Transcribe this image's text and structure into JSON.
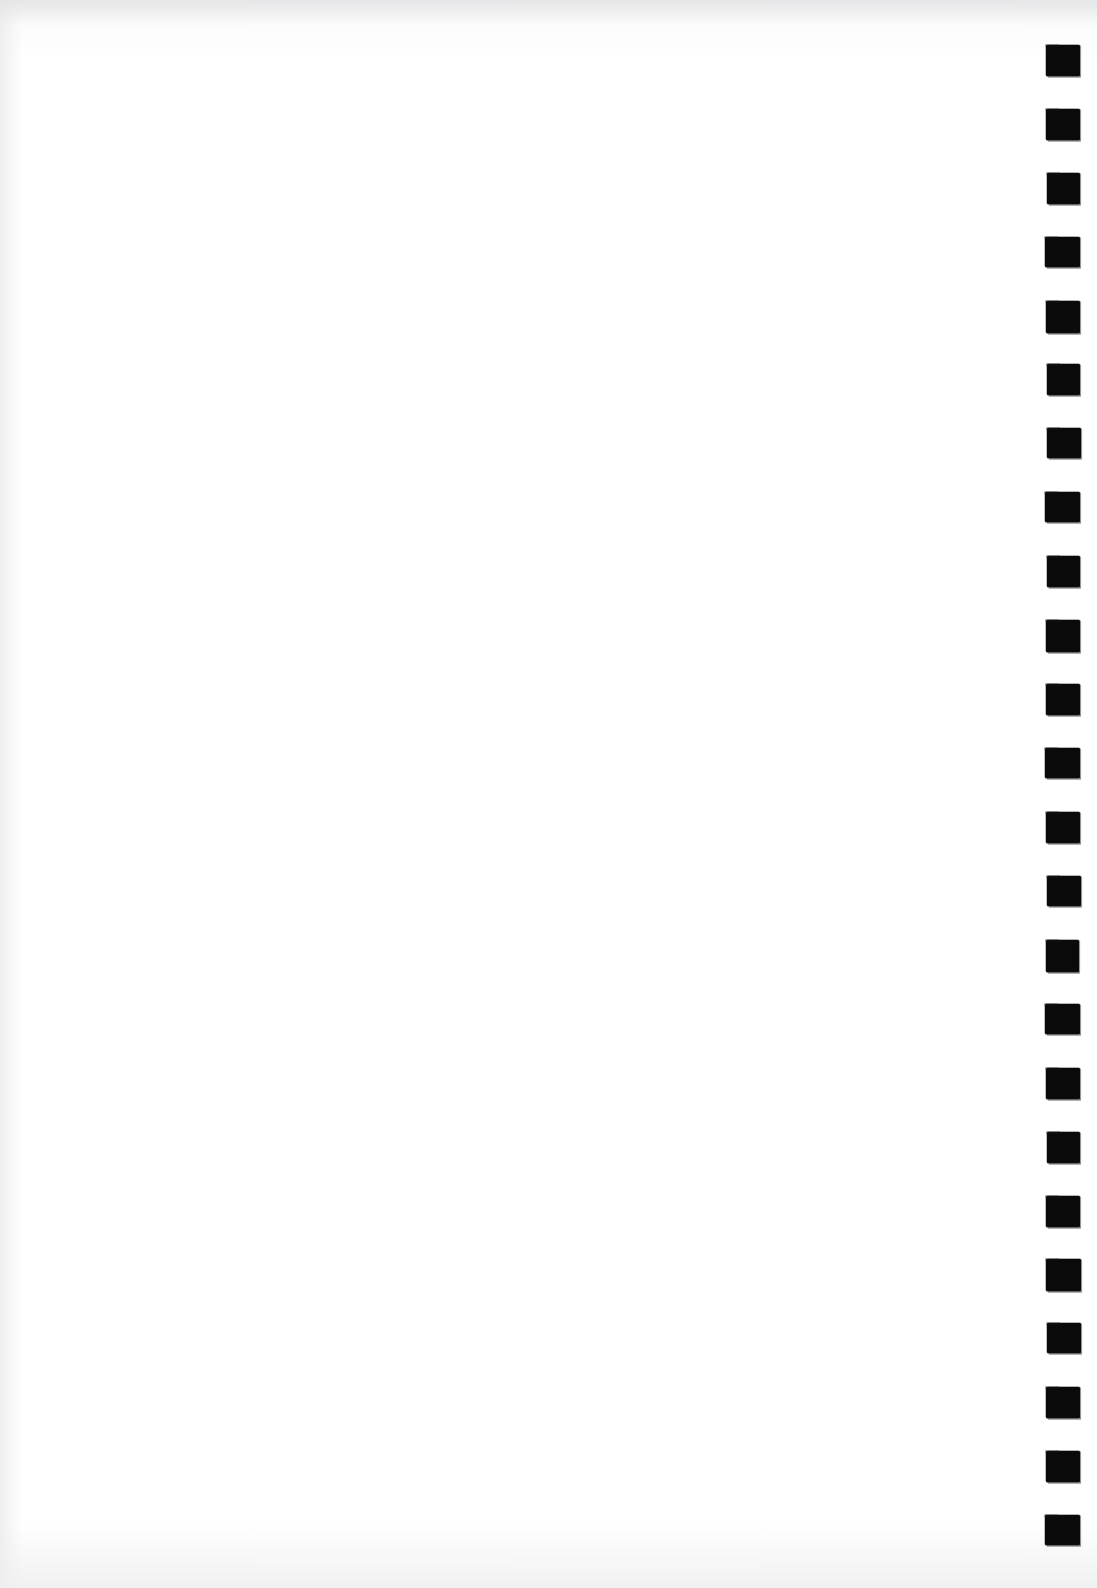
{
  "document": {
    "kind": "scanned-page",
    "page_background_color": "#ffffff",
    "content": {
      "visible_text": "",
      "note": "blank"
    }
  },
  "marker_strip": {
    "name": "registration-mark-column",
    "position": "right-edge",
    "mark_color": "#0a0a0a",
    "mark_shape": "square",
    "mark_count": 24,
    "mark_width_px": 34,
    "mark_height_px": 31,
    "strip_left_px": 1030,
    "first_mark_top_px": 45,
    "mark_pitch_px": 63.9,
    "marks": [
      {
        "index": 1,
        "top": 45
      },
      {
        "index": 2,
        "top": 109
      },
      {
        "index": 3,
        "top": 173
      },
      {
        "index": 4,
        "top": 237
      },
      {
        "index": 5,
        "top": 301
      },
      {
        "index": 6,
        "top": 364
      },
      {
        "index": 7,
        "top": 428
      },
      {
        "index": 8,
        "top": 492
      },
      {
        "index": 9,
        "top": 556
      },
      {
        "index": 10,
        "top": 620
      },
      {
        "index": 11,
        "top": 684
      },
      {
        "index": 12,
        "top": 748
      },
      {
        "index": 13,
        "top": 812
      },
      {
        "index": 14,
        "top": 876
      },
      {
        "index": 15,
        "top": 940
      },
      {
        "index": 16,
        "top": 1004
      },
      {
        "index": 17,
        "top": 1068
      },
      {
        "index": 18,
        "top": 1132
      },
      {
        "index": 19,
        "top": 1196
      },
      {
        "index": 20,
        "top": 1259
      },
      {
        "index": 21,
        "top": 1323
      },
      {
        "index": 22,
        "top": 1387
      },
      {
        "index": 23,
        "top": 1451
      },
      {
        "index": 24,
        "top": 1515
      }
    ]
  },
  "scan_artifacts": {
    "top_band_color": "#e2e2e4",
    "bottom_band_color": "#eeeeef",
    "left_edge_color": "#ededee"
  }
}
